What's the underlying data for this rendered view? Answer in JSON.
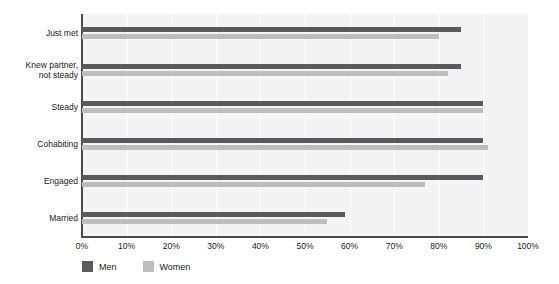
{
  "chart_data": {
    "type": "bar",
    "orientation": "horizontal",
    "title": "",
    "xlabel": "",
    "ylabel": "",
    "xlim": [
      0,
      100
    ],
    "xtick_labels": [
      "0%",
      "10%",
      "20%",
      "30%",
      "40%",
      "50%",
      "60%",
      "70%",
      "80%",
      "90%",
      "100%"
    ],
    "xtick_values": [
      0,
      10,
      20,
      30,
      40,
      50,
      60,
      70,
      80,
      90,
      100
    ],
    "grid": true,
    "grid_axis": "x",
    "legend_position": "bottom-left",
    "categories": [
      "Just met",
      "Knew partner,\nnot steady",
      "Steady",
      "Cohabiting",
      "Engaged",
      "Married"
    ],
    "series": [
      {
        "name": "Men",
        "color": "#5a5a5e",
        "values": [
          85,
          85,
          90,
          90,
          90,
          59
        ]
      },
      {
        "name": "Women",
        "color": "#bdbdbd",
        "values": [
          80,
          82,
          90,
          91,
          77,
          55
        ]
      }
    ]
  },
  "legend": {
    "items": [
      {
        "label": "Men",
        "color": "#5a5a5e"
      },
      {
        "label": "Women",
        "color": "#bdbdbd"
      }
    ]
  },
  "colors": {
    "men": "#5a5a5e",
    "women": "#bdbdbd",
    "plot_background": "#f4f4f4",
    "axis": "#4c4c4c",
    "gridline": "#fdfdfd",
    "text": "#1a1a1a"
  }
}
